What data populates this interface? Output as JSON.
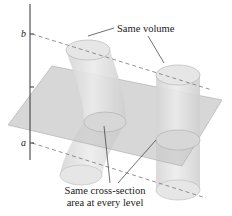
{
  "diagram": {
    "labels": {
      "b": "b",
      "a": "a",
      "same_volume": "Same volume",
      "cross_section_line1": "Same cross-section",
      "cross_section_line2": "area at every level"
    },
    "colors": {
      "plane_fill": "#c8c8c8",
      "solid_fill": "#dcdcdc",
      "solid_stroke": "#9a9a9a",
      "line": "#333333",
      "dashed": "#777777"
    }
  }
}
